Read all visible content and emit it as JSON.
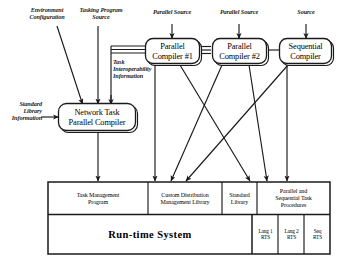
{
  "diagram": {
    "input_labels": [
      {
        "id": "environment-configuration",
        "text": "Environment\nConfiguration"
      },
      {
        "id": "tasking-program-source",
        "text": "Tasking Program\nSource"
      },
      {
        "id": "parallel-source-1",
        "text": "Parallel Source"
      },
      {
        "id": "parallel-source-2",
        "text": "Parallel Source"
      },
      {
        "id": "source",
        "text": "Source"
      },
      {
        "id": "task-interoperability-information",
        "text": "Task\nInteroperability\nInformation"
      },
      {
        "id": "standard-library-information",
        "text": "Standard\nLibrary\nInformation"
      }
    ],
    "compilers": [
      {
        "id": "parallel-compiler-1",
        "text": "Parallel\nCompiler #1"
      },
      {
        "id": "parallel-compiler-2",
        "text": "Parallel\nCompiler #2"
      },
      {
        "id": "sequential-compiler",
        "text": "Sequential\nCompiler"
      }
    ],
    "network_compiler": {
      "id": "network-task-parallel-compiler",
      "text": "Network Task\nParallel Compiler"
    },
    "output_cells": [
      {
        "id": "task-management-program",
        "text": "Task Management\nProgram"
      },
      {
        "id": "custom-distribution-management-library",
        "text": "Custom Distribution\nManagement Library"
      },
      {
        "id": "standard-library",
        "text": "Standard\nLibrary"
      },
      {
        "id": "parallel-and-sequential-task-procedures",
        "text": "Parallel and\nSequential Task\nProcedures"
      }
    ],
    "runtime": {
      "id": "run-time-system",
      "label": "Run-time System",
      "rts_cells": [
        {
          "id": "lang-1-rts",
          "text": "Lang 1\nRTS"
        },
        {
          "id": "lang-2-rts",
          "text": "Lang 2\nRTS"
        },
        {
          "id": "seq-rts",
          "text": "Seq\nRTS"
        }
      ]
    },
    "colors": {
      "line": "#1a1a1a",
      "text": "#000000",
      "background": "#ffffff"
    }
  }
}
